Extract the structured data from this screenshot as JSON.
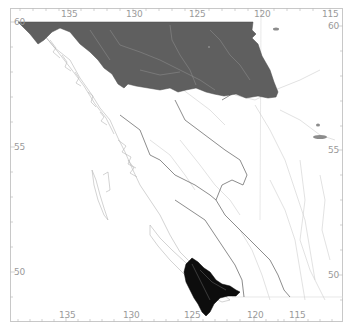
{
  "map": {
    "title": "",
    "colors": {
      "background": "#ffffff",
      "frame": "#c8c8c8",
      "labels": "#9a9a9a",
      "rivers": "#cfcfcf",
      "boundaries": "#6e6e6e",
      "northern_region_fill": "#5f5f5f",
      "southern_region_fill": "#0d0d0d",
      "lakes": "#8c8c8c"
    },
    "axes": {
      "top": [
        {
          "label": "135",
          "x": 68
        },
        {
          "label": "130",
          "x": 133
        },
        {
          "label": "125",
          "x": 196
        },
        {
          "label": "120",
          "x": 261
        },
        {
          "label": "115",
          "x": 330
        }
      ],
      "bottom": [
        {
          "label": "135",
          "x": 66
        },
        {
          "label": "130",
          "x": 130
        },
        {
          "label": "125",
          "x": 191
        },
        {
          "label": "120",
          "x": 254
        },
        {
          "label": "115",
          "x": 296
        }
      ],
      "left": [
        {
          "label": "60",
          "y": 22
        },
        {
          "label": "55",
          "y": 147
        },
        {
          "label": "50",
          "y": 272
        }
      ],
      "right": [
        {
          "label": "60",
          "y": 26
        },
        {
          "label": "55",
          "y": 150
        },
        {
          "label": "50",
          "y": 275
        }
      ]
    },
    "regions": [
      {
        "name": "northern-region",
        "shade": "dark-grey"
      },
      {
        "name": "southern-region",
        "shade": "black"
      }
    ]
  }
}
